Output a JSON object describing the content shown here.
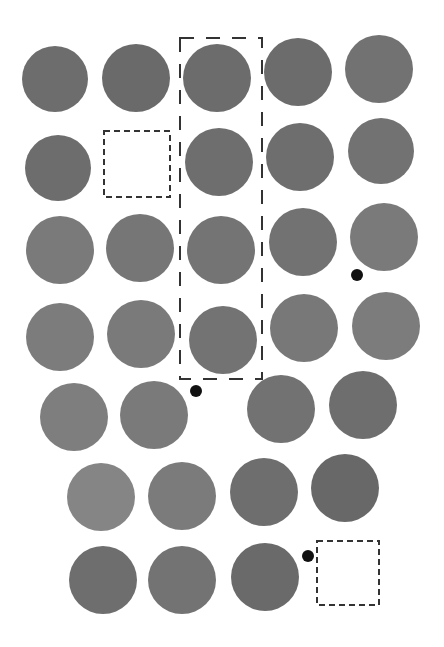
{
  "title": "",
  "colors": {
    "background": "#ffffff",
    "dark": "#6b6b6b",
    "medium": "#737373",
    "light": "#7e7e7e",
    "lighter": "#888888",
    "marker": "#111111",
    "outline": "#333333"
  },
  "circles": [
    {
      "row": 1,
      "col": 1,
      "cx": 55,
      "cy": 79,
      "r": 33,
      "shade": "#6d6d6d"
    },
    {
      "row": 1,
      "col": 2,
      "cx": 136,
      "cy": 78,
      "r": 34,
      "shade": "#6a6a6a"
    },
    {
      "row": 1,
      "col": 3,
      "cx": 217,
      "cy": 78,
      "r": 34,
      "shade": "#6c6c6c"
    },
    {
      "row": 1,
      "col": 4,
      "cx": 298,
      "cy": 72,
      "r": 34,
      "shade": "#6c6c6c"
    },
    {
      "row": 1,
      "col": 5,
      "cx": 379,
      "cy": 69,
      "r": 34,
      "shade": "#727272"
    },
    {
      "row": 2,
      "col": 1,
      "cx": 58,
      "cy": 168,
      "r": 33,
      "shade": "#6d6d6d"
    },
    {
      "row": 2,
      "col": 3,
      "cx": 219,
      "cy": 162,
      "r": 34,
      "shade": "#6e6e6e"
    },
    {
      "row": 2,
      "col": 4,
      "cx": 300,
      "cy": 157,
      "r": 34,
      "shade": "#6e6e6e"
    },
    {
      "row": 2,
      "col": 5,
      "cx": 381,
      "cy": 151,
      "r": 33,
      "shade": "#727272"
    },
    {
      "row": 3,
      "col": 1,
      "cx": 60,
      "cy": 250,
      "r": 34,
      "shade": "#7a7a7a"
    },
    {
      "row": 3,
      "col": 2,
      "cx": 140,
      "cy": 248,
      "r": 34,
      "shade": "#767676"
    },
    {
      "row": 3,
      "col": 3,
      "cx": 221,
      "cy": 250,
      "r": 34,
      "shade": "#747474"
    },
    {
      "row": 3,
      "col": 4,
      "cx": 303,
      "cy": 242,
      "r": 34,
      "shade": "#727272"
    },
    {
      "row": 3,
      "col": 5,
      "cx": 384,
      "cy": 237,
      "r": 34,
      "shade": "#7a7a7a"
    },
    {
      "row": 4,
      "col": 1,
      "cx": 60,
      "cy": 337,
      "r": 34,
      "shade": "#7c7c7c"
    },
    {
      "row": 4,
      "col": 2,
      "cx": 141,
      "cy": 334,
      "r": 34,
      "shade": "#7a7a7a"
    },
    {
      "row": 4,
      "col": 3,
      "cx": 223,
      "cy": 340,
      "r": 34,
      "shade": "#737373"
    },
    {
      "row": 4,
      "col": 4,
      "cx": 304,
      "cy": 328,
      "r": 34,
      "shade": "#787878"
    },
    {
      "row": 4,
      "col": 5,
      "cx": 386,
      "cy": 326,
      "r": 34,
      "shade": "#7c7c7c"
    },
    {
      "row": 5,
      "col": 1,
      "cx": 74,
      "cy": 417,
      "r": 34,
      "shade": "#7e7e7e"
    },
    {
      "row": 5,
      "col": 2,
      "cx": 154,
      "cy": 415,
      "r": 34,
      "shade": "#7a7a7a"
    },
    {
      "row": 5,
      "col": 4,
      "cx": 281,
      "cy": 409,
      "r": 34,
      "shade": "#727272"
    },
    {
      "row": 5,
      "col": 5,
      "cx": 363,
      "cy": 405,
      "r": 34,
      "shade": "#6e6e6e"
    },
    {
      "row": 6,
      "col": 1,
      "cx": 101,
      "cy": 497,
      "r": 34,
      "shade": "#858585"
    },
    {
      "row": 6,
      "col": 2,
      "cx": 182,
      "cy": 496,
      "r": 34,
      "shade": "#7b7b7b"
    },
    {
      "row": 6,
      "col": 3,
      "cx": 264,
      "cy": 492,
      "r": 34,
      "shade": "#6e6e6e"
    },
    {
      "row": 6,
      "col": 4,
      "cx": 345,
      "cy": 488,
      "r": 34,
      "shade": "#686868"
    },
    {
      "row": 7,
      "col": 1,
      "cx": 103,
      "cy": 580,
      "r": 34,
      "shade": "#6e6e6e"
    },
    {
      "row": 7,
      "col": 2,
      "cx": 182,
      "cy": 580,
      "r": 34,
      "shade": "#737373"
    },
    {
      "row": 7,
      "col": 3,
      "cx": 265,
      "cy": 577,
      "r": 34,
      "shade": "#6a6a6a"
    }
  ],
  "markers": [
    {
      "name": "marker-dot-1",
      "cx": 357,
      "cy": 275,
      "r": 6
    },
    {
      "name": "marker-dot-2",
      "cx": 196,
      "cy": 391,
      "r": 6
    },
    {
      "name": "marker-dot-3",
      "cx": 308,
      "cy": 556,
      "r": 6
    }
  ],
  "empty_slots": [
    {
      "name": "empty-slot-row2",
      "x": 104,
      "y": 131,
      "w": 66,
      "h": 66
    },
    {
      "name": "empty-slot-row7",
      "x": 317,
      "y": 541,
      "w": 62,
      "h": 64
    }
  ],
  "highlight_column": {
    "x": 180,
    "y": 38,
    "w": 82,
    "h": 341
  }
}
